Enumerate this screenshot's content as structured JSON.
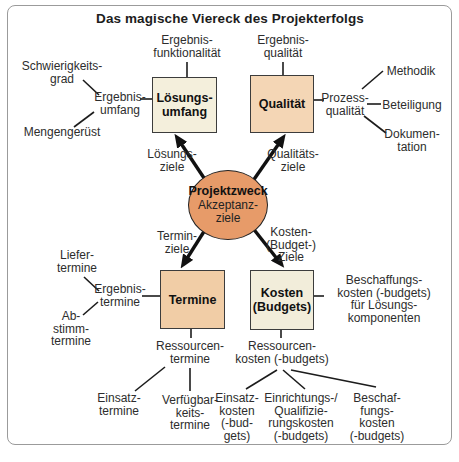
{
  "title": "Das magische Viereck des Projekterfolgs",
  "center": {
    "name": "Projektzweck",
    "sub": "Akzeptanz-\nziele"
  },
  "boxes": {
    "loesungsumfang": "Lösungs-\numfang",
    "qualitaet": "Qualität",
    "termine": "Termine",
    "kosten": "Kosten\n(Budgets)"
  },
  "arrow_labels": {
    "loesungsziele": "Lösungs-\nziele",
    "qualitaetsziele": "Qualitäts-\nziele",
    "terminziele": "Termin-\nziele",
    "kostenziele": "Kosten-\n(Budget-)\nZiele"
  },
  "satellites": {
    "ergebnisfunktionalitaet": "Ergebnis-\nfunktionalität",
    "ergebnisqualitaet": "Ergebnis-\nqualität",
    "schwierigkeitsgrad": "Schwierigkeits-\ngrad",
    "ergebnisumfang": "Ergebnis-\numfang",
    "mengengeruest": "Mengengerüst",
    "methodik": "Methodik",
    "prozessqualitaet": "Prozess-\nqualität",
    "beteiligung": "Beteiligung",
    "dokumentation": "Dokumen-\ntation",
    "liefertermine": "Liefer-\ntermine",
    "ergebnistermine": "Ergebnis-\ntermine",
    "abstimmtermine": "Ab-\nstimm-\ntermine",
    "beschaffungskosten_loesung": "Beschaffungs-\nkosten (-budgets)\nfür Lösungs-\nkomponenten",
    "ressourcentermine": "Ressourcen-\ntermine",
    "ressourcenkosten": "Ressourcen-\nkosten (-budgets)",
    "einsatztermine": "Einsatz-\ntermine",
    "verfuegbarkeitstermine": "Verfügbar-\nkeits-\ntermine",
    "einsatzkosten": "Einsatz-\nkosten\n(-bud-\ngets)",
    "einrichtungskosten": "Einrichtungs-/\nQualifizie-\nrungskosten\n(-budgets)",
    "beschaffungskosten": "Beschaf-\nfungs-\nkosten\n(-budgets)"
  },
  "colors": {
    "frame": "#9b9b9b",
    "line": "#1c1c1c",
    "boxborder": "#3c3c3c",
    "cream": "#f4efdc",
    "cream2": "#f2edda",
    "peach": "#f4d6b5",
    "peach2": "#f1cda6",
    "ellipse": "#e79b69",
    "text": "#2d2d2d"
  }
}
